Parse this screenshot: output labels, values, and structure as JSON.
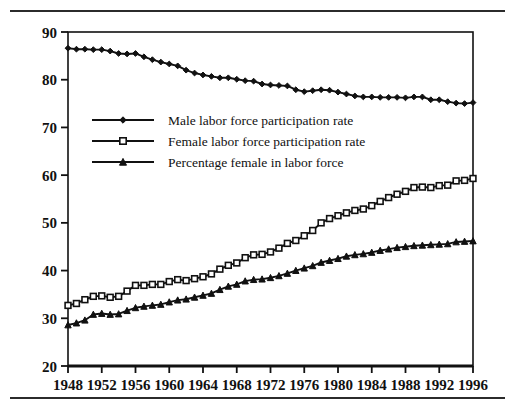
{
  "figure": {
    "rules": [
      "top-rule",
      "bottom-rule"
    ]
  },
  "chart_data": {
    "type": "line",
    "title": "",
    "subtitle": "",
    "xlabel": "",
    "ylabel": "",
    "xlim": [
      1948,
      1996
    ],
    "ylim": [
      20,
      90
    ],
    "grid": false,
    "legend_position": "upper-left-inside",
    "x_tick_labels": [
      "1948",
      "1952",
      "1956",
      "1960",
      "1964",
      "1968",
      "1972",
      "1976",
      "1980",
      "1984",
      "1988",
      "1992",
      "1996"
    ],
    "y_tick_labels": [
      "20",
      "30",
      "40",
      "50",
      "60",
      "70",
      "80",
      "90"
    ],
    "x_ticks": [
      1948,
      1952,
      1956,
      1960,
      1964,
      1968,
      1972,
      1976,
      1980,
      1984,
      1988,
      1992,
      1996
    ],
    "y_ticks": [
      20,
      30,
      40,
      50,
      60,
      70,
      80,
      90
    ],
    "x": [
      1948,
      1949,
      1950,
      1951,
      1952,
      1953,
      1954,
      1955,
      1956,
      1957,
      1958,
      1959,
      1960,
      1961,
      1962,
      1963,
      1964,
      1965,
      1966,
      1967,
      1968,
      1969,
      1970,
      1971,
      1972,
      1973,
      1974,
      1975,
      1976,
      1977,
      1978,
      1979,
      1980,
      1981,
      1982,
      1983,
      1984,
      1985,
      1986,
      1987,
      1988,
      1989,
      1990,
      1991,
      1992,
      1993,
      1994,
      1995,
      1996
    ],
    "series": [
      {
        "name": "Male labor force participation rate",
        "marker": "diamond",
        "values": [
          86.6,
          86.4,
          86.4,
          86.3,
          86.3,
          86.0,
          85.5,
          85.4,
          85.5,
          84.8,
          84.2,
          83.7,
          83.3,
          82.9,
          82.0,
          81.4,
          81.0,
          80.7,
          80.4,
          80.4,
          80.1,
          79.8,
          79.7,
          79.1,
          78.9,
          78.8,
          78.7,
          77.9,
          77.5,
          77.7,
          77.9,
          77.8,
          77.4,
          77.0,
          76.6,
          76.4,
          76.4,
          76.3,
          76.3,
          76.3,
          76.2,
          76.4,
          76.4,
          75.8,
          75.8,
          75.4,
          75.1,
          75.0,
          75.2
        ]
      },
      {
        "name": "Female labor force participation rate",
        "marker": "open-square",
        "values": [
          32.7,
          33.1,
          33.9,
          34.6,
          34.7,
          34.4,
          34.6,
          35.7,
          36.9,
          36.9,
          37.1,
          37.1,
          37.7,
          38.1,
          37.9,
          38.3,
          38.7,
          39.3,
          40.3,
          41.1,
          41.6,
          42.7,
          43.3,
          43.4,
          43.9,
          44.7,
          45.7,
          46.3,
          47.3,
          48.4,
          50.0,
          50.9,
          51.5,
          52.1,
          52.6,
          52.9,
          53.6,
          54.5,
          55.3,
          56.0,
          56.6,
          57.4,
          57.5,
          57.4,
          57.8,
          57.9,
          58.8,
          58.9,
          59.3
        ]
      },
      {
        "name": "Percentage female in labor force",
        "marker": "triangle",
        "values": [
          28.6,
          29.0,
          29.6,
          30.8,
          31.0,
          30.8,
          30.9,
          31.6,
          32.2,
          32.5,
          32.7,
          32.9,
          33.4,
          33.8,
          34.0,
          34.4,
          34.8,
          35.2,
          36.0,
          36.7,
          37.1,
          37.8,
          38.1,
          38.2,
          38.5,
          38.9,
          39.4,
          40.0,
          40.5,
          41.0,
          41.7,
          42.1,
          42.5,
          43.0,
          43.3,
          43.5,
          43.8,
          44.2,
          44.5,
          44.8,
          45.0,
          45.2,
          45.3,
          45.4,
          45.5,
          45.6,
          46.0,
          46.1,
          46.2
        ]
      }
    ],
    "legend": [
      {
        "label": "Male labor force participation rate",
        "marker": "diamond"
      },
      {
        "label": "Female labor force participation rate",
        "marker": "open-square"
      },
      {
        "label": "Percentage female in labor force",
        "marker": "triangle"
      }
    ]
  }
}
